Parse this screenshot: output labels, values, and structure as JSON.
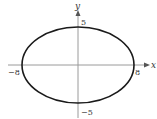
{
  "diagram": {
    "type": "ellipse-graph",
    "axes": {
      "x_label": "x",
      "y_label": "y"
    },
    "ellipse": {
      "center": [
        0,
        0
      ],
      "semi_major_x": 8,
      "semi_minor_y": 5
    },
    "tick_labels": {
      "x_neg": "−8",
      "x_pos": "8",
      "y_pos": "5",
      "y_neg": "−5"
    },
    "colors": {
      "curve": "#1a1a1a",
      "axis": "#888888",
      "text": "#333333"
    }
  }
}
